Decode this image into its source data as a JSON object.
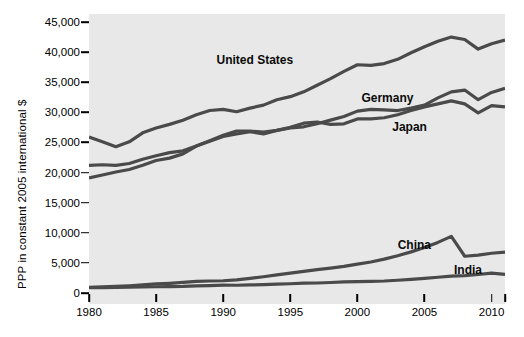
{
  "chart_data": {
    "type": "line",
    "title": "",
    "xlabel": "",
    "ylabel": "PPP in constant 2005 international $",
    "xlim": [
      1980,
      2011
    ],
    "ylim": [
      0,
      45000
    ],
    "grid": false,
    "legend_position": "inline-labels",
    "xticks": [
      1980,
      1985,
      1990,
      1995,
      2000,
      2005,
      2010
    ],
    "xtick_labels": [
      "1980",
      "1985",
      "1990",
      "1995",
      "2000",
      "2005",
      "2010"
    ],
    "extra_xticks": [
      2011
    ],
    "yticks": [
      0,
      5000,
      10000,
      15000,
      20000,
      25000,
      30000,
      35000,
      40000,
      45000
    ],
    "ytick_labels": [
      "0",
      "5,000",
      "10,000",
      "15,000",
      "20,000",
      "25,000",
      "30,000",
      "35,000",
      "40,000",
      "45,000"
    ],
    "plot_background": "#e8e8e8",
    "line_color": "#4a4a4a",
    "x": [
      1980,
      1981,
      1982,
      1983,
      1984,
      1985,
      1986,
      1987,
      1988,
      1989,
      1990,
      1991,
      1992,
      1993,
      1994,
      1995,
      1996,
      1997,
      1998,
      1999,
      2000,
      2001,
      2002,
      2003,
      2004,
      2005,
      2006,
      2007,
      2008,
      2009,
      2010,
      2011
    ],
    "series": [
      {
        "name": "United States",
        "label": "United States",
        "label_x": 1989.5,
        "label_y": 38700,
        "values": [
          25900,
          25100,
          24300,
          25100,
          26600,
          27400,
          28000,
          28700,
          29600,
          30300,
          30500,
          30100,
          30700,
          31200,
          32100,
          32600,
          33400,
          34500,
          35600,
          36800,
          37900,
          37800,
          38100,
          38800,
          39900,
          40900,
          41800,
          42500,
          42100,
          40500,
          41400,
          42000
        ],
        "start_value": 25900,
        "end_value": 42000,
        "peak_value": 42500,
        "peak_year": 2007
      },
      {
        "name": "Germany",
        "label": "Germany",
        "label_x": 2000.3,
        "label_y": 32400,
        "values": [
          21200,
          21300,
          21200,
          21500,
          22200,
          22800,
          23300,
          23600,
          24400,
          25200,
          26000,
          26400,
          26800,
          26400,
          27000,
          27400,
          27600,
          28100,
          28700,
          29300,
          30200,
          30500,
          30400,
          30300,
          30700,
          31200,
          32400,
          33400,
          33700,
          32100,
          33300,
          34000
        ],
        "start_value": 21200,
        "end_value": 34000
      },
      {
        "name": "Japan",
        "label": "Japan",
        "label_x": 2002.6,
        "label_y": 27500,
        "values": [
          19100,
          19600,
          20100,
          20500,
          21200,
          22000,
          22400,
          23100,
          24400,
          25300,
          26200,
          26900,
          26900,
          26700,
          27000,
          27500,
          28200,
          28400,
          28000,
          28100,
          28900,
          28900,
          29100,
          29600,
          30300,
          30900,
          31400,
          31900,
          31400,
          29900,
          31100,
          30900
        ],
        "start_value": 19100,
        "end_value": 30900
      },
      {
        "name": "China",
        "label": "China",
        "label_x": 2003.0,
        "label_y": 7900,
        "values": [
          950,
          1010,
          1090,
          1190,
          1340,
          1500,
          1610,
          1760,
          1930,
          1990,
          2030,
          2180,
          2420,
          2700,
          3000,
          3300,
          3580,
          3870,
          4120,
          4410,
          4790,
          5150,
          5620,
          6190,
          6830,
          7550,
          8400,
          9400,
          6100,
          6300,
          6600,
          6800
        ],
        "start_value": 950,
        "end_value": 6800
      },
      {
        "name": "India",
        "label": "India",
        "label_x": 2007.2,
        "label_y": 3800,
        "values": [
          880,
          900,
          920,
          970,
          1000,
          1040,
          1070,
          1090,
          1180,
          1240,
          1300,
          1290,
          1340,
          1390,
          1460,
          1540,
          1630,
          1660,
          1740,
          1840,
          1880,
          1940,
          1990,
          2120,
          2260,
          2430,
          2620,
          2810,
          2890,
          3070,
          3300,
          3100
        ],
        "start_value": 880,
        "end_value": 3100
      }
    ]
  }
}
